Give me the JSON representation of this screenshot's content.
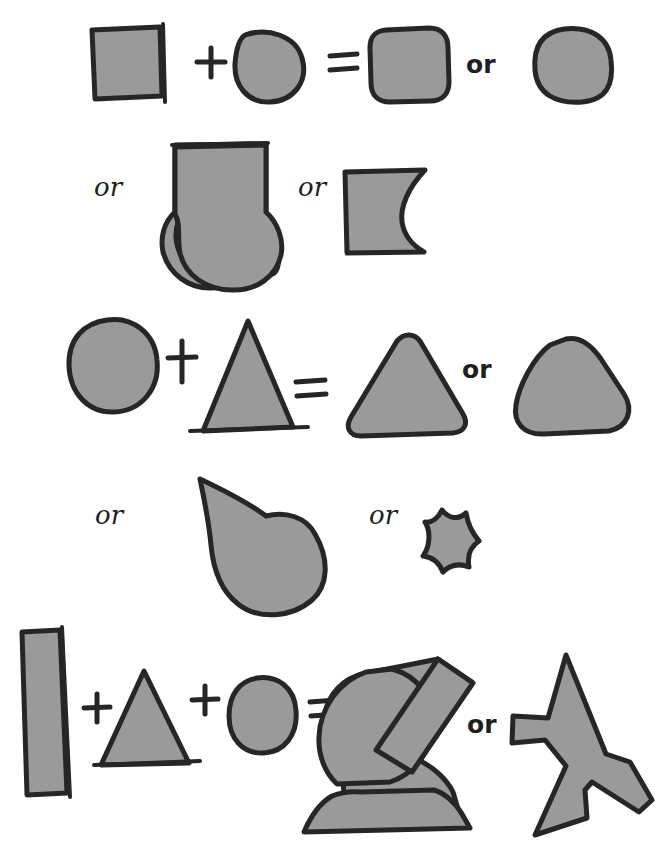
{
  "diagram": {
    "style": "hand-drawn sketch, gray filled shapes with dark ink outlines",
    "colors": {
      "fill": "#9a9a9a",
      "stroke": "#262626",
      "background": "#ffffff"
    },
    "operators": {
      "plus": "+",
      "equals": "=",
      "or": "or"
    },
    "equations": [
      {
        "id": "equation-1",
        "operands": [
          {
            "name": "square",
            "label": "square"
          },
          {
            "name": "circle",
            "label": "circle"
          }
        ],
        "results": [
          {
            "name": "rounded-square-small-radius",
            "label": "rounded square"
          },
          {
            "name": "rounded-square-large-radius",
            "label": "rounded square (softer)"
          },
          {
            "name": "square-with-circle-bottom",
            "label": "square with circular bottom"
          },
          {
            "name": "square-with-circular-bite",
            "label": "square with circular bite"
          }
        ]
      },
      {
        "id": "equation-2",
        "operands": [
          {
            "name": "circle",
            "label": "circle"
          },
          {
            "name": "triangle",
            "label": "triangle"
          }
        ],
        "results": [
          {
            "name": "rounded-triangle",
            "label": "rounded triangle"
          },
          {
            "name": "blob-triangle",
            "label": "very rounded triangle"
          },
          {
            "name": "teardrop",
            "label": "teardrop"
          },
          {
            "name": "concave-pentagon",
            "label": "concave star-like shape"
          }
        ]
      },
      {
        "id": "equation-3",
        "operands": [
          {
            "name": "rectangle",
            "label": "tall rectangle"
          },
          {
            "name": "triangle",
            "label": "triangle"
          },
          {
            "name": "circle",
            "label": "circle"
          }
        ],
        "results": [
          {
            "name": "hill-with-chimney",
            "label": "hill with angled chimney on a base"
          },
          {
            "name": "arrow-star",
            "label": "jagged arrow star"
          }
        ]
      }
    ],
    "or_labels": [
      {
        "id": "or-1",
        "text": "or"
      },
      {
        "id": "or-2",
        "text": "or"
      },
      {
        "id": "or-3",
        "text": "or"
      },
      {
        "id": "or-4",
        "text": "or"
      },
      {
        "id": "or-5",
        "text": "or"
      },
      {
        "id": "or-6",
        "text": "or"
      },
      {
        "id": "or-7",
        "text": "or"
      }
    ],
    "plus_signs": [
      {
        "id": "plus-1"
      },
      {
        "id": "plus-2"
      },
      {
        "id": "plus-3"
      },
      {
        "id": "plus-4"
      }
    ],
    "equals_signs": [
      {
        "id": "equals-1"
      },
      {
        "id": "equals-2"
      },
      {
        "id": "equals-3"
      }
    ]
  }
}
